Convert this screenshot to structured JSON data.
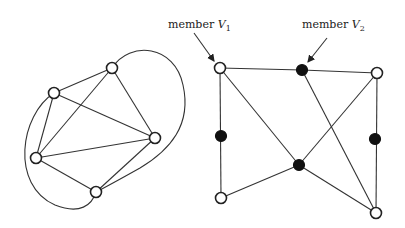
{
  "labels": {
    "v1": {
      "prefix": "member ",
      "var": "V",
      "sub": "1"
    },
    "v2": {
      "prefix": "member ",
      "var": "V",
      "sub": "2"
    }
  },
  "left_graph": {
    "nodes": [
      {
        "id": "a",
        "x": 112,
        "y": 68,
        "type": "open"
      },
      {
        "id": "b",
        "x": 54,
        "y": 93,
        "type": "open"
      },
      {
        "id": "c",
        "x": 155,
        "y": 138,
        "type": "open"
      },
      {
        "id": "d",
        "x": 36,
        "y": 158,
        "type": "open"
      },
      {
        "id": "e",
        "x": 96,
        "y": 192,
        "type": "open"
      }
    ],
    "edges": [
      [
        "a",
        "b"
      ],
      [
        "a",
        "c"
      ],
      [
        "a",
        "d"
      ],
      [
        "b",
        "c"
      ],
      [
        "b",
        "d"
      ],
      [
        "c",
        "d"
      ],
      [
        "c",
        "e"
      ],
      [
        "d",
        "e"
      ]
    ],
    "curved_edges": [
      "b-e (outer left loop)",
      "a-e (outer right loop)"
    ]
  },
  "right_graph": {
    "nodes": [
      {
        "id": "V1",
        "x": 220,
        "y": 68,
        "type": "open"
      },
      {
        "id": "V2",
        "x": 302,
        "y": 70,
        "type": "filled"
      },
      {
        "id": "tr",
        "x": 377,
        "y": 73,
        "type": "open"
      },
      {
        "id": "ml",
        "x": 221,
        "y": 136,
        "type": "filled"
      },
      {
        "id": "mc",
        "x": 299,
        "y": 165,
        "type": "filled"
      },
      {
        "id": "mr",
        "x": 375,
        "y": 139,
        "type": "filled"
      },
      {
        "id": "bl",
        "x": 221,
        "y": 198,
        "type": "open"
      },
      {
        "id": "br",
        "x": 376,
        "y": 213,
        "type": "open"
      }
    ],
    "edges": [
      [
        "V1",
        "V2"
      ],
      [
        "V2",
        "tr"
      ],
      [
        "V1",
        "ml"
      ],
      [
        "ml",
        "bl"
      ],
      [
        "V1",
        "mc"
      ],
      [
        "tr",
        "mc"
      ],
      [
        "bl",
        "mc"
      ],
      [
        "mc",
        "br"
      ],
      [
        "V2",
        "br"
      ],
      [
        "tr",
        "mr"
      ],
      [
        "mr",
        "br"
      ]
    ]
  }
}
